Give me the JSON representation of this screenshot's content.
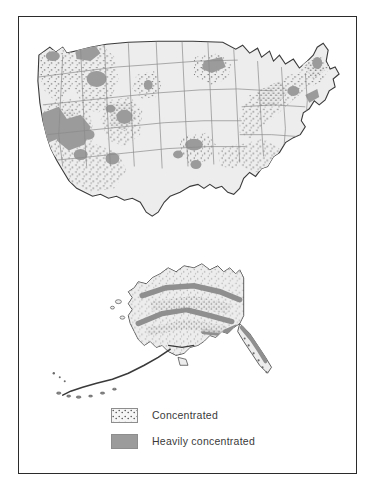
{
  "figure": {
    "border_color": "#2b2b2b",
    "background": "#ffffff"
  },
  "legend": {
    "items": [
      {
        "label": "Concentrated",
        "pattern": "stipple",
        "swatch_color": "#f4f4f4",
        "icon": "stipple-swatch-icon"
      },
      {
        "label": "Heavily concentrated",
        "pattern": "solid",
        "swatch_color": "#9b9b9b",
        "icon": "solid-swatch-icon"
      }
    ]
  },
  "maps": [
    {
      "name": "contiguous-united-states",
      "label": "Contiguous United States",
      "land_color": "#ededed",
      "outline_color": "#3a3a3a",
      "state_border_color": "#8e8e8e",
      "stipple_color": "#6f6f6f",
      "heavy_color": "#9b9b9b",
      "regions_heavy": [
        "Puget Sound Washington",
        "Western Montana / Idaho panhandle",
        "Central Idaho",
        "Northern California / Sierra Nevada",
        "Nevada basin and range",
        "Southwest Utah",
        "Central Colorado Rockies",
        "Western Colorado",
        "Black Hills South Dakota",
        "Northern Arizona",
        "Central New Mexico",
        "Ozarks Missouri / Arkansas",
        "Northern Alabama",
        "Lake Superior Michigan",
        "Appalachian Pennsylvania",
        "Northern New England"
      ],
      "regions_concentrated": [
        "Pacific Northwest",
        "Great Basin",
        "Rocky Mountain states",
        "Southwest",
        "Great Plains margin",
        "Upper Midwest",
        "Appalachian Mountains",
        "Northeast corridor",
        "Southeast piedmont",
        "Florida"
      ]
    },
    {
      "name": "alaska-inset",
      "label": "Alaska",
      "land_color": "#ededed",
      "outline_color": "#3a3a3a",
      "stipple_color": "#6f6f6f",
      "heavy_color": "#9b9b9b",
      "regions_heavy": [
        "Brooks Range",
        "Alaska Range",
        "Wrangell / Saint Elias Mountains",
        "Southeast Alaska panhandle"
      ],
      "regions_concentrated": [
        "Interior Alaska",
        "Southcentral Alaska",
        "Aleutian chain"
      ]
    }
  ]
}
